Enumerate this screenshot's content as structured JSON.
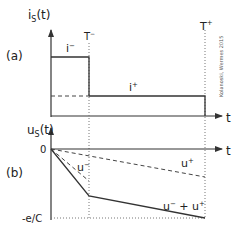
{
  "figure": {
    "panel_a": {
      "label": "(a)",
      "y_axis_label": "i",
      "y_axis_sub": "S",
      "y_axis_arg": "(t)",
      "x_axis_label": "t",
      "markers": {
        "t_minus": "T",
        "t_minus_sup": "−",
        "t_plus": "T",
        "t_plus_sup": "+"
      },
      "curves": {
        "i_minus": {
          "label": "i",
          "sup": "−"
        },
        "i_plus": {
          "label": "i",
          "sup": "+"
        }
      }
    },
    "panel_b": {
      "label": "(b)",
      "y_axis_label": "u",
      "y_axis_sub": "S",
      "y_axis_arg": "(t)",
      "x_axis_label": "t",
      "zero_label": "0",
      "min_label": "-e/C",
      "curves": {
        "u_minus": {
          "label": "u",
          "sup": "−"
        },
        "u_plus": {
          "label": "u",
          "sup": "+"
        },
        "u_sum": {
          "label": "u",
          "sup1": "−",
          "plus": " + ",
          "label2": "u",
          "sup2": "+"
        }
      }
    },
    "credit": "Kolanoski, Wermes 2015"
  }
}
